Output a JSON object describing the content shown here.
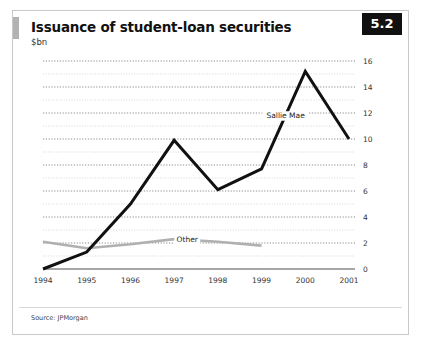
{
  "figure": {
    "title": "Issuance of student-loan securities",
    "subtitle": "$bn",
    "badge": "5.2",
    "source": "Source: JPMorgan",
    "accent_color": "#111111",
    "secondary_color": "#b0b0b0"
  },
  "chart_data": {
    "type": "line",
    "title": "Issuance of student-loan securities",
    "subtitle": "$bn",
    "xlabel": "",
    "ylabel": "$bn",
    "ylim": [
      0,
      16
    ],
    "yticks": [
      0,
      2,
      4,
      6,
      8,
      10,
      12,
      14,
      16
    ],
    "ytick_labels": [
      "0",
      "2",
      "4",
      "6",
      "8",
      "10",
      "12",
      "14",
      "16"
    ],
    "minor_gridlines": true,
    "grid": true,
    "legend": "inline-annotation",
    "categories": [
      "1994",
      "1995",
      "1996",
      "1997",
      "1998",
      "1999",
      "2000",
      "2001"
    ],
    "x": [
      1994,
      1995,
      1996,
      1997,
      1998,
      1999,
      2000,
      2001
    ],
    "series": [
      {
        "name": "Sallie Mae",
        "color": "#111111",
        "values": [
          0.0,
          1.3,
          5.0,
          9.9,
          6.1,
          7.7,
          15.2,
          10.0
        ]
      },
      {
        "name": "Other",
        "color": "#b0b0b0",
        "values": [
          2.1,
          1.6,
          1.9,
          2.3,
          2.1,
          1.8,
          null,
          null
        ]
      }
    ],
    "annotations": [
      {
        "text": "Sallie Mae",
        "x": 1999.55,
        "y": 11.6
      },
      {
        "text": "Other",
        "x": 1997.3,
        "y": 2.05
      }
    ]
  }
}
